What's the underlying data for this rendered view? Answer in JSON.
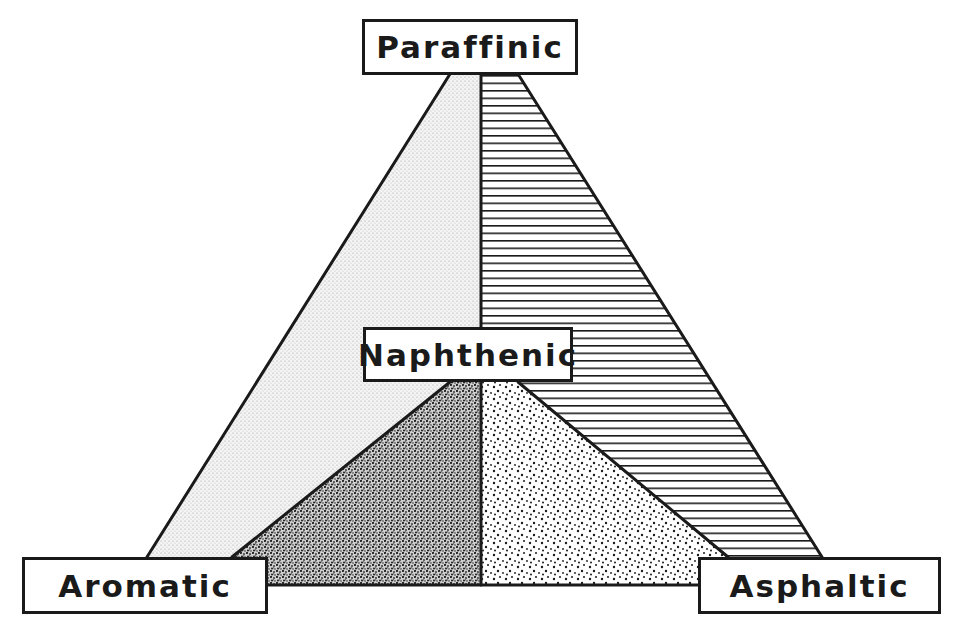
{
  "diagram": {
    "type": "ternary-classification-triangle",
    "labels": {
      "top": "Paraffinic",
      "center": "Naphthenic",
      "bottom_left": "Aromatic",
      "bottom_right": "Asphaltic"
    },
    "regions": [
      {
        "name": "paraffinic-aromatic",
        "pattern": "fine-stipple",
        "position": "outer-left"
      },
      {
        "name": "paraffinic-asphaltic",
        "pattern": "horizontal-lines",
        "position": "outer-right"
      },
      {
        "name": "naphthenic-aromatic",
        "pattern": "dense-stipple",
        "position": "inner-left"
      },
      {
        "name": "naphthenic-asphaltic",
        "pattern": "sparse-dots",
        "position": "inner-right"
      }
    ],
    "colors": {
      "ink": "#1a1a1a",
      "background": "#ffffff"
    }
  }
}
